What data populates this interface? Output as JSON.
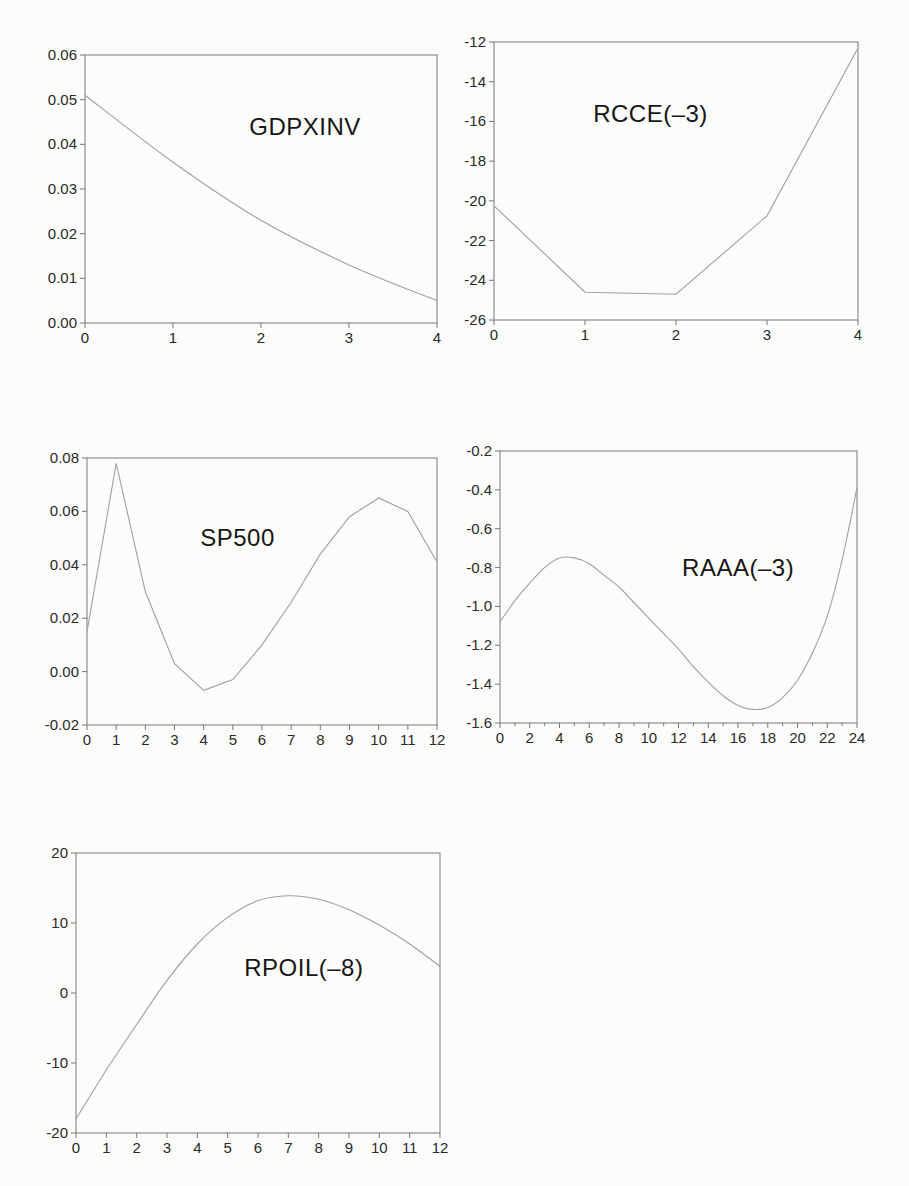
{
  "page": {
    "style": {
      "curve_color": "#a0a0a0",
      "frame_color": "#787878",
      "tick_color": "#787878",
      "label_color": "#2a2a2a",
      "title_color": "#161616",
      "background": "#fcfcfb"
    }
  },
  "chart_data": [
    {
      "type": "line",
      "title": "GDPXINV",
      "xlabel": "",
      "ylabel": "",
      "x": [
        0,
        1,
        2,
        3,
        4
      ],
      "values": [
        0.051,
        0.036,
        0.023,
        0.013,
        0.005
      ],
      "xlim": [
        0,
        4
      ],
      "ylim": [
        0,
        0.06
      ],
      "xtick_vals": [
        0,
        1,
        2,
        3,
        4
      ],
      "xtick_labels": [
        "0",
        "1",
        "2",
        "3",
        "4"
      ],
      "xminor_vals": [],
      "ytick_vals": [
        0,
        0.01,
        0.02,
        0.03,
        0.04,
        0.05,
        0.06
      ],
      "ytick_labels": [
        "0.00",
        "0.01",
        "0.02",
        "0.03",
        "0.04",
        "0.05",
        "0.06"
      ],
      "grid": false,
      "legend": "none",
      "smooth": true,
      "title_pos": [
        0.625,
        0.27
      ]
    },
    {
      "type": "line",
      "title": "RCCE(–3)",
      "xlabel": "",
      "ylabel": "",
      "x": [
        0,
        1,
        2,
        3,
        4
      ],
      "values": [
        -20.25,
        -24.6,
        -24.7,
        -20.75,
        -12.3
      ],
      "xlim": [
        0,
        4
      ],
      "ylim": [
        -26,
        -12
      ],
      "xtick_vals": [
        0,
        1,
        2,
        3,
        4
      ],
      "xtick_labels": [
        "0",
        "1",
        "2",
        "3",
        "4"
      ],
      "xminor_vals": [],
      "ytick_vals": [
        -26,
        -24,
        -22,
        -20,
        -18,
        -16,
        -14,
        -12
      ],
      "ytick_labels": [
        "-26",
        "-24",
        "-22",
        "-20",
        "-18",
        "-16",
        "-14",
        "-12"
      ],
      "grid": false,
      "legend": "none",
      "smooth": false,
      "title_pos": [
        0.43,
        0.26
      ]
    },
    {
      "type": "line",
      "title": "SP500",
      "xlabel": "",
      "ylabel": "",
      "x": [
        0,
        1,
        2,
        3,
        4,
        5,
        6,
        7,
        8,
        9,
        10,
        11,
        12
      ],
      "values": [
        0.015,
        0.078,
        0.03,
        0.003,
        -0.007,
        -0.003,
        0.01,
        0.026,
        0.044,
        0.058,
        0.065,
        0.06,
        0.041
      ],
      "xlim": [
        0,
        12
      ],
      "ylim": [
        -0.02,
        0.08
      ],
      "xtick_vals": [
        0,
        1,
        2,
        3,
        4,
        5,
        6,
        7,
        8,
        9,
        10,
        11,
        12
      ],
      "xtick_labels": [
        "0",
        "1",
        "2",
        "3",
        "4",
        "5",
        "6",
        "7",
        "8",
        "9",
        "10",
        "11",
        "12"
      ],
      "xminor_vals": [],
      "ytick_vals": [
        -0.02,
        0,
        0.02,
        0.04,
        0.06,
        0.08
      ],
      "ytick_labels": [
        "-0.02",
        "0.00",
        "0.02",
        "0.04",
        "0.06",
        "0.08"
      ],
      "grid": false,
      "legend": "none",
      "smooth": false,
      "title_pos": [
        0.43,
        0.3
      ]
    },
    {
      "type": "line",
      "title": "RAAA(–3)",
      "xlabel": "",
      "ylabel": "",
      "x": [
        0,
        1,
        2,
        3,
        4,
        5,
        6,
        7,
        8,
        9,
        10,
        11,
        12,
        13,
        14,
        15,
        16,
        17,
        18,
        19,
        20,
        21,
        22,
        23,
        24
      ],
      "values": [
        -1.08,
        -0.97,
        -0.88,
        -0.8,
        -0.75,
        -0.75,
        -0.78,
        -0.84,
        -0.9,
        -0.98,
        -1.06,
        -1.14,
        -1.22,
        -1.31,
        -1.39,
        -1.46,
        -1.51,
        -1.53,
        -1.52,
        -1.47,
        -1.38,
        -1.24,
        -1.05,
        -0.76,
        -0.39
      ],
      "xlim": [
        0,
        24
      ],
      "ylim": [
        -1.6,
        -0.2
      ],
      "xtick_vals": [
        0,
        2,
        4,
        6,
        8,
        10,
        12,
        14,
        16,
        18,
        20,
        22,
        24
      ],
      "xtick_labels": [
        "0",
        "2",
        "4",
        "6",
        "8",
        "10",
        "12",
        "14",
        "16",
        "18",
        "20",
        "22",
        "24"
      ],
      "xminor_vals": [
        1,
        3,
        5,
        7,
        9,
        11,
        13,
        15,
        17,
        19,
        21,
        23
      ],
      "ytick_vals": [
        -1.6,
        -1.4,
        -1.2,
        -1.0,
        -0.8,
        -0.6,
        -0.4,
        -0.2
      ],
      "ytick_labels": [
        "-1.6",
        "-1.4",
        "-1.2",
        "-1.0",
        "-0.8",
        "-0.6",
        "-0.4",
        "-0.2"
      ],
      "grid": false,
      "legend": "none",
      "smooth": true,
      "title_pos": [
        0.667,
        0.43
      ]
    },
    {
      "type": "line",
      "title": "RPOIL(–8)",
      "xlabel": "",
      "ylabel": "",
      "x": [
        0,
        1,
        2,
        3,
        4,
        5,
        6,
        7,
        8,
        9,
        10,
        11,
        12
      ],
      "values": [
        -18,
        -11,
        -4.5,
        1.8,
        7,
        10.8,
        13.2,
        13.9,
        13.4,
        11.9,
        9.7,
        7,
        3.8
      ],
      "xlim": [
        0,
        12
      ],
      "ylim": [
        -20,
        20
      ],
      "xtick_vals": [
        0,
        1,
        2,
        3,
        4,
        5,
        6,
        7,
        8,
        9,
        10,
        11,
        12
      ],
      "xtick_labels": [
        "0",
        "1",
        "2",
        "3",
        "4",
        "5",
        "6",
        "7",
        "8",
        "9",
        "10",
        "11",
        "12"
      ],
      "xminor_vals": [],
      "ytick_vals": [
        -20,
        -10,
        0,
        10,
        20
      ],
      "ytick_labels": [
        "-20",
        "-10",
        "0",
        "10",
        "20"
      ],
      "grid": false,
      "legend": "none",
      "smooth": true,
      "title_pos": [
        0.626,
        0.41
      ]
    }
  ]
}
